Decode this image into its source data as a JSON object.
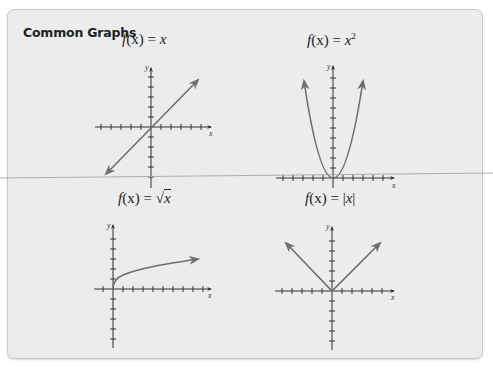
{
  "card": {
    "title": "Common Graphs"
  },
  "graphs": [
    {
      "id": "identity",
      "label_fn": "f",
      "label_arg": "(x)",
      "label_eq": " = ",
      "label_rhs": "x",
      "x_axis_label": "x",
      "y_axis_label": "y"
    },
    {
      "id": "square",
      "label_fn": "f",
      "label_arg": "(x)",
      "label_eq": " = ",
      "label_rhs": "x",
      "label_sup": "2",
      "x_axis_label": "x",
      "y_axis_label": "y"
    },
    {
      "id": "sqrt",
      "label_fn": "f",
      "label_arg": "(x)",
      "label_eq": " = ",
      "label_root": "√",
      "label_rhs": "x",
      "x_axis_label": "x",
      "y_axis_label": "y"
    },
    {
      "id": "abs",
      "label_fn": "f",
      "label_arg": "(x)",
      "label_eq": " = ",
      "label_bar_l": "|",
      "label_rhs": "x",
      "label_bar_r": "|",
      "x_axis_label": "x",
      "y_axis_label": "y"
    }
  ],
  "colors": {
    "curve": "#6f6f6f",
    "axis": "#333333",
    "card_bg": "#ececec",
    "divider": "#a8a8a8"
  }
}
